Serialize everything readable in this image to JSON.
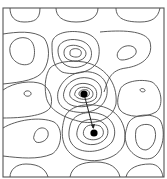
{
  "diagram": {
    "type": "contour-plot",
    "frame": {
      "x": 3,
      "y": 8,
      "width": 161,
      "height": 169
    },
    "colors": {
      "line": "#4a4a4a",
      "frame": "#555555",
      "marker": "#000000"
    },
    "minima": [
      {
        "name": "upper-minimum",
        "cx": 84,
        "cy": 94,
        "r": 3.6
      },
      {
        "name": "lower-minimum",
        "cx": 94,
        "cy": 133,
        "r": 3.6
      }
    ],
    "path_between_minima": {
      "x1": 84,
      "y1": 94,
      "x2": 93,
      "y2": 128
    },
    "contours": [
      "M10,8 C10,16 14,22 24,22 C34,22 40,20 40,8",
      "M56,8 C56,16 62,22 76,22 C90,22 98,17 98,8",
      "M116,8 C116,18 124,22 140,22 C152,22 158,18 160,8",
      "M3,34 C16,32 34,30 44,38 C50,46 50,60 44,70 C38,80 22,82 3,84",
      "M10,52 C8,42 18,36 26,38 C36,40 36,56 32,62 C26,68 12,64 10,52",
      "M52,44 C52,34 66,30 80,32 C96,34 102,44 98,60 C94,72 74,76 62,72 C52,66 52,54 52,44",
      "M58,50 C58,42 68,38 78,40 C90,42 94,52 90,60 C84,68 72,70 64,64 C60,60 58,56 58,50",
      "M64,52 C64,46 72,44 78,46 C86,48 88,54 84,58 C80,62 70,62 66,58 C64,56 64,54 64,52",
      "M70,52 C70,49 75,48 78,49 C82,50 82,54 80,56 C77,58 72,57 70,55 Z",
      "M118,52 C122,44 134,44 136,50 C138,56 128,60 122,60 C118,60 116,56 118,52",
      "M100,32 C120,30 146,30 150,42 C154,58 140,66 126,68 C110,70 108,80 104,92",
      "M3,90 C14,82 32,80 42,84 C50,88 54,100 50,108 C44,116 22,118 3,118",
      "M24,94 C24,90 30,90 31,93 C32,96 26,98 24,94",
      "M120,90 C122,82 140,78 152,82 C162,88 164,106 156,112 C146,118 126,118 120,110 C116,104 118,96 120,90",
      "M140,90 C140,88 144,88 145,90 C146,92 141,93 140,90",
      "M58,92 C62,78 76,70 90,72 C104,74 110,86 106,98 C102,110 88,114 76,112 C62,110 56,104 58,92",
      "M64,92 C66,82 78,76 88,78 C100,80 104,90 100,98 C96,106 84,108 74,106 C66,104 62,98 64,92",
      "M70,92 C72,85 80,82 88,84 C96,86 98,92 96,98 C92,103 82,104 76,101 C70,98 69,96 70,92",
      "M75,93 C76,88 82,86 88,88 C93,90 94,94 92,97 C89,100 82,100 78,98 C75,96 74,95 75,93",
      "M79,93 C80,90 84,89 87,90 C90,91 90,95 88,96 C85,98 81,97 79,95 Z",
      "M50,68 C56,62 70,60 84,62 C104,66 118,82 116,104 C112,120 96,124 82,122 C64,118 48,110 46,96 C44,84 46,74 50,68",
      "M3,128 C16,120 40,116 54,122 C64,128 62,148 52,154 C38,160 20,158 3,156",
      "M34,136 C36,126 46,126 48,132 C50,140 40,144 36,142 C34,140 33,138 34,136",
      "M70,126 C72,114 88,110 100,114 C114,118 118,132 112,142 C104,152 86,154 76,148 C68,142 68,134 70,126",
      "M78,128 C80,120 90,118 98,120 C108,124 110,132 106,138 C100,146 88,146 82,142 C76,138 76,134 78,128",
      "M84,130 C86,124 94,124 100,126 C105,130 104,136 100,138 C95,141 88,140 85,137 C83,135 83,132 84,130",
      "M64,120 C66,108 82,102 100,106 C120,110 128,128 124,144 C118,160 94,164 78,158 C62,152 60,134 64,120",
      "M128,124 C132,114 152,112 160,120 C166,130 164,152 152,158 C140,162 128,152 126,142 C124,136 126,130 128,124",
      "M136,130 C138,124 150,122 154,128 C158,136 154,148 146,150 C138,150 134,142 136,130",
      "M10,177 C10,170 16,164 26,164 C40,164 46,170 48,177",
      "M70,177 C72,166 82,162 96,162 C110,162 118,168 120,177",
      "M126,177 C128,168 138,164 150,164 C158,164 162,170 163,177"
    ]
  }
}
